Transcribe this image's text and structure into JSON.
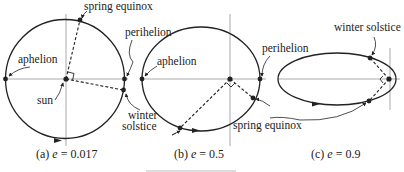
{
  "figure": {
    "panels": [
      {
        "id": "a",
        "caption_prefix": "(a)",
        "caption_var": "e",
        "caption_eq": " = 0.017",
        "labels": {
          "spring_equinox": "spring equinox",
          "perihelion": "perihelion",
          "aphelion": "aphelion",
          "sun": "sun",
          "winter": "winter",
          "solstice": "solstice"
        }
      },
      {
        "id": "b",
        "caption_prefix": "(b)",
        "caption_var": "e",
        "caption_eq": " = 0.5",
        "labels": {
          "perihelion": "perihelion",
          "aphelion": "aphelion",
          "spring_equinox": "spring equinox"
        }
      },
      {
        "id": "c",
        "caption_prefix": "(c)",
        "caption_var": "e",
        "caption_eq": " = 0.9",
        "labels": {
          "winter_solstice": "winter solstice"
        }
      }
    ],
    "colors": {
      "ink": "#222222",
      "axis": "#888888",
      "background": "#ffffff"
    }
  }
}
